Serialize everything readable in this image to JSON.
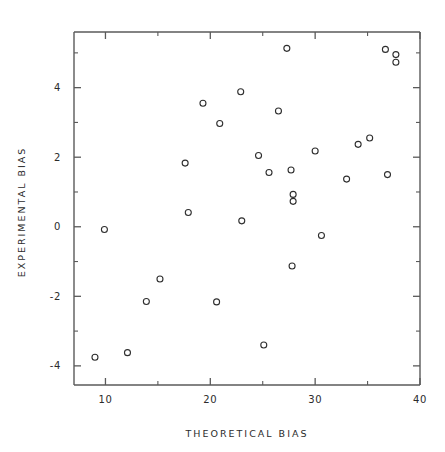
{
  "chart_data": {
    "type": "scatter",
    "title": "",
    "xlabel": "THEORETICAL BIAS",
    "ylabel": "EXPERIMENTAL BIAS",
    "xlim": [
      7,
      40
    ],
    "ylim": [
      -4.55,
      5.6
    ],
    "grid": false,
    "legend": null,
    "marker": "open-circle",
    "x_ticks_major": [
      10,
      20,
      30,
      40
    ],
    "x_ticks_minor": [
      15,
      25,
      35
    ],
    "y_ticks_major": [
      4,
      2,
      0,
      -2,
      -4
    ],
    "y_ticks_minor": [
      5,
      3,
      1,
      -1,
      -3
    ],
    "x_tick_labels": [
      "10",
      "20",
      "30",
      "40"
    ],
    "y_tick_labels": [
      "4",
      "2",
      "0",
      "-2",
      "-4"
    ],
    "points": [
      {
        "x": 9.0,
        "y": -3.75
      },
      {
        "x": 9.9,
        "y": -0.08
      },
      {
        "x": 12.1,
        "y": -3.62
      },
      {
        "x": 13.9,
        "y": -2.15
      },
      {
        "x": 15.2,
        "y": -1.5
      },
      {
        "x": 17.6,
        "y": 1.83
      },
      {
        "x": 17.9,
        "y": 0.41
      },
      {
        "x": 19.3,
        "y": 3.55
      },
      {
        "x": 20.6,
        "y": -2.16
      },
      {
        "x": 20.9,
        "y": 2.97
      },
      {
        "x": 22.9,
        "y": 3.88
      },
      {
        "x": 23.0,
        "y": 0.17
      },
      {
        "x": 24.6,
        "y": 2.05
      },
      {
        "x": 25.1,
        "y": -3.4
      },
      {
        "x": 25.6,
        "y": 1.56
      },
      {
        "x": 26.5,
        "y": 3.33
      },
      {
        "x": 27.3,
        "y": 5.13
      },
      {
        "x": 27.7,
        "y": 1.63
      },
      {
        "x": 27.9,
        "y": 0.93
      },
      {
        "x": 27.9,
        "y": 0.73
      },
      {
        "x": 27.8,
        "y": -1.13
      },
      {
        "x": 30.0,
        "y": 2.18
      },
      {
        "x": 30.6,
        "y": -0.25
      },
      {
        "x": 33.0,
        "y": 1.37
      },
      {
        "x": 34.1,
        "y": 2.37
      },
      {
        "x": 35.2,
        "y": 2.55
      },
      {
        "x": 36.7,
        "y": 5.1
      },
      {
        "x": 36.9,
        "y": 1.5
      },
      {
        "x": 37.7,
        "y": 4.95
      },
      {
        "x": 37.7,
        "y": 4.73
      }
    ],
    "colors": {
      "marker_stroke": "#2e2e2e",
      "axis": "#5a5a5a",
      "text": "#2b2b2b",
      "background": "#ffffff"
    }
  }
}
